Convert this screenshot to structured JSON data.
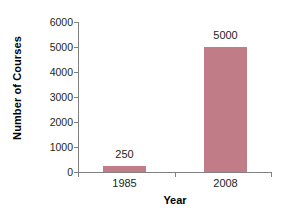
{
  "chart_data": {
    "type": "bar",
    "title": "",
    "subtitle": "",
    "categories": [
      "1985",
      "2008"
    ],
    "values": [
      250,
      5000
    ],
    "series": [
      {
        "name": "Number of Courses",
        "values": [
          250,
          5000
        ]
      }
    ],
    "data_labels": [
      "250",
      "5000"
    ],
    "xlabel": "Year",
    "ylabel": "Number of Courses",
    "ylim": [
      0,
      6000
    ],
    "ytick_labels": [
      "0",
      "1000",
      "2000",
      "3000",
      "4000",
      "5000",
      "6000"
    ],
    "ytick_values": [
      0,
      1000,
      2000,
      3000,
      4000,
      5000,
      6000
    ],
    "grid": false,
    "legend": false,
    "legend_position": "none",
    "bar_color": "#c17d87",
    "axis_color": "#808080",
    "text_color": "#231f20",
    "background_color": "#ffffff"
  }
}
